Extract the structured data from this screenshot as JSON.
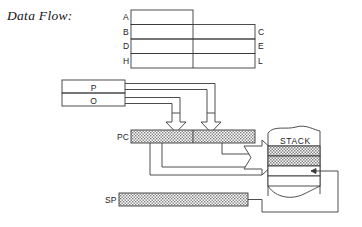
{
  "figure": {
    "title": "Data Flow:",
    "type": "block-diagram"
  },
  "register_file": {
    "name": "register-file",
    "left_labels": [
      "A",
      "B",
      "D",
      "H"
    ],
    "right_labels": [
      "C",
      "E",
      "L"
    ],
    "rows": [
      {
        "left": "A",
        "right": "",
        "split": false
      },
      {
        "left": "B",
        "right": "C",
        "split": true
      },
      {
        "left": "D",
        "right": "E",
        "split": true
      },
      {
        "left": "H",
        "right": "L",
        "split": true
      }
    ]
  },
  "po_register": {
    "name": "po-register",
    "rows": [
      "P",
      "O"
    ]
  },
  "program_counter": {
    "label": "PC",
    "fill": "hatched"
  },
  "stack_pointer": {
    "label": "SP",
    "fill": "hatched"
  },
  "stack": {
    "label": "STACK",
    "rows": [
      {
        "fill": "shaded"
      },
      {
        "fill": "shaded"
      },
      {
        "fill": "empty"
      },
      {
        "fill": "empty"
      }
    ]
  },
  "colors": {
    "stroke": "#3a3a3a",
    "hatch": "#6f6f6f",
    "text": "#1f1f1f",
    "background": "#ffffff"
  },
  "arrows": [
    {
      "name": "po-to-pc-low",
      "direction": "down"
    },
    {
      "name": "po-to-pc-high",
      "direction": "down"
    },
    {
      "name": "pc-to-stack",
      "direction": "right"
    },
    {
      "name": "sp-to-stack",
      "direction": "left"
    }
  ]
}
